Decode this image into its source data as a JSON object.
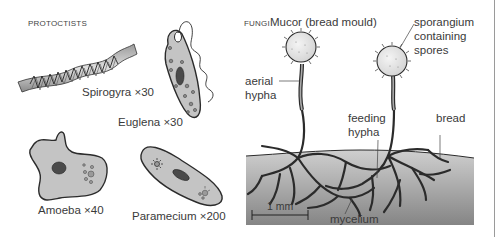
{
  "protoctists": {
    "section_label": "PROTOCTISTS",
    "organisms": [
      {
        "name": "spirogyra",
        "caption": "Spirogyra ×30"
      },
      {
        "name": "euglena",
        "caption": "Euglena ×30"
      },
      {
        "name": "amoeba",
        "caption": "Amoeba ×40"
      },
      {
        "name": "paramecium",
        "caption": "Paramecium ×200"
      }
    ]
  },
  "fungi": {
    "section_label": "FUNGI",
    "title": "Mucor (bread mould)",
    "labels": {
      "sporangium_line1": "sporangium",
      "sporangium_line2": "containing",
      "sporangium_line3": "spores",
      "aerial_line1": "aerial",
      "aerial_line2": "hypha",
      "feeding_line1": "feeding",
      "feeding_line2": "hypha",
      "bread": "bread",
      "mycelium": "mycelium",
      "scale_bar": "1 mm"
    }
  },
  "colors": {
    "cell_fill": "#c4c4c4",
    "outline": "#2b2b2b",
    "nucleus": "#4a4a4a",
    "bread_top": "#c9c9c9",
    "bread_bottom": "#8a8a8a",
    "sporangium_fill": "#ececec"
  }
}
